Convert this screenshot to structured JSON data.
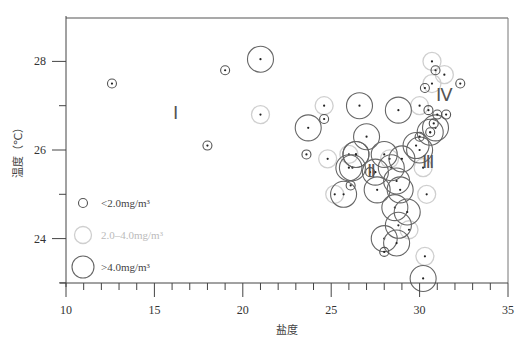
{
  "chart_data": {
    "type": "scatter",
    "title": "",
    "xlabel": "盐度",
    "ylabel": "温度（℃）",
    "xlim": [
      10,
      35
    ],
    "ylim": [
      23,
      29
    ],
    "x_ticks": [
      10,
      15,
      20,
      25,
      30,
      35
    ],
    "y_ticks": [
      24,
      26,
      28
    ],
    "grid": false,
    "legend_position": "lower-left inside",
    "legend": [
      {
        "label": "<2.0mg/m³",
        "size": "small",
        "color": "#555555"
      },
      {
        "label": "2.0–4.0mg/m³",
        "size": "medium",
        "color": "#c8c8c8"
      },
      {
        "label": ">4.0mg/m³",
        "size": "large",
        "color": "#555555"
      }
    ],
    "annotations": [
      {
        "text": "Ⅰ",
        "x": 16.2,
        "y": 26.7
      },
      {
        "text": "Ⅱ",
        "x": 27.3,
        "y": 25.4
      },
      {
        "text": "Ⅲ",
        "x": 30.5,
        "y": 25.6
      },
      {
        "text": "Ⅳ",
        "x": 31.4,
        "y": 27.1
      }
    ],
    "series": [
      {
        "name": "<2.0mg/m³",
        "points": [
          [
            12.6,
            27.5
          ],
          [
            19.0,
            27.8
          ],
          [
            18.0,
            26.1
          ],
          [
            24.6,
            26.7
          ],
          [
            23.6,
            25.9
          ],
          [
            26.1,
            25.2
          ],
          [
            27.2,
            25.5
          ],
          [
            28.0,
            23.7
          ],
          [
            30.3,
            27.4
          ],
          [
            30.9,
            27.8
          ],
          [
            32.3,
            27.5
          ],
          [
            30.5,
            26.9
          ],
          [
            31.0,
            26.8
          ],
          [
            31.5,
            26.8
          ],
          [
            30.8,
            26.6
          ],
          [
            30.6,
            26.4
          ],
          [
            30.0,
            26.3
          ]
        ]
      },
      {
        "name": "2.0–4.0mg/m³",
        "points": [
          [
            21.0,
            26.8
          ],
          [
            24.6,
            27.0
          ],
          [
            24.8,
            25.8
          ],
          [
            25.2,
            25.0
          ],
          [
            26.0,
            25.9
          ],
          [
            30.0,
            27.0
          ],
          [
            30.7,
            28.0
          ],
          [
            31.4,
            27.7
          ],
          [
            30.7,
            27.5
          ],
          [
            30.2,
            25.6
          ],
          [
            30.4,
            25.0
          ],
          [
            29.4,
            24.2
          ],
          [
            30.3,
            23.6
          ],
          [
            28.3,
            25.8
          ]
        ]
      },
      {
        "name": ">4.0mg/m³",
        "points": [
          [
            21.0,
            28.05
          ],
          [
            23.7,
            26.5
          ],
          [
            26.6,
            27.0
          ],
          [
            28.8,
            26.9
          ],
          [
            27.0,
            26.3
          ],
          [
            26.0,
            25.6
          ],
          [
            26.4,
            25.9
          ],
          [
            25.7,
            25.0
          ],
          [
            26.2,
            25.6
          ],
          [
            27.5,
            25.5
          ],
          [
            27.6,
            25.1
          ],
          [
            28.0,
            25.9
          ],
          [
            28.4,
            25.6
          ],
          [
            28.7,
            25.3
          ],
          [
            28.9,
            25.1
          ],
          [
            29.0,
            25.8
          ],
          [
            29.8,
            26.1
          ],
          [
            30.0,
            26.0
          ],
          [
            30.6,
            26.4
          ],
          [
            30.9,
            26.5
          ],
          [
            28.6,
            24.7
          ],
          [
            29.3,
            24.6
          ],
          [
            28.8,
            24.3
          ],
          [
            28.0,
            24.0
          ],
          [
            28.7,
            23.9
          ],
          [
            30.2,
            23.1
          ],
          [
            26.4,
            25.9
          ]
        ]
      }
    ]
  }
}
